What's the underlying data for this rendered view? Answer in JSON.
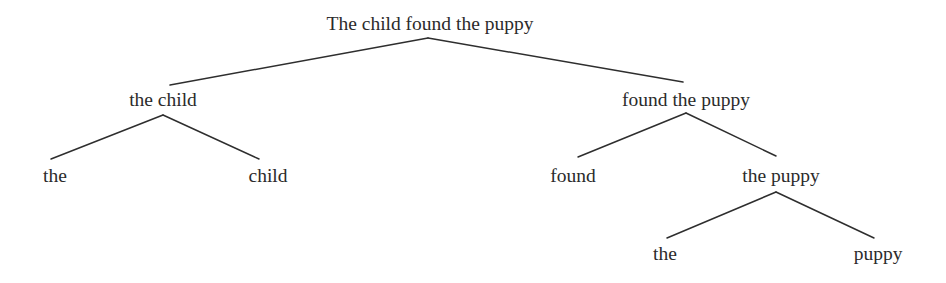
{
  "diagram": {
    "type": "constituency-tree",
    "colors": {
      "text": "#2b2b2b",
      "line": "#2e2e2e",
      "background": "#ffffff"
    },
    "nodes": {
      "root": {
        "label": "The child found the puppy",
        "x": 430,
        "top": 14
      },
      "np_subject": {
        "label": "the child",
        "x": 163,
        "top": 90
      },
      "vp": {
        "label": "found the puppy",
        "x": 686,
        "top": 90
      },
      "det_subject": {
        "label": "the",
        "x": 55,
        "top": 166
      },
      "noun_subject": {
        "label": "child",
        "x": 268,
        "top": 166
      },
      "verb": {
        "label": "found",
        "x": 573,
        "top": 166
      },
      "np_object": {
        "label": "the puppy",
        "x": 781,
        "top": 166
      },
      "det_object": {
        "label": "the",
        "x": 665,
        "top": 244
      },
      "noun_object": {
        "label": "puppy",
        "x": 878,
        "top": 244
      }
    },
    "edges": [
      {
        "from": "root",
        "to": "np_subject",
        "x1": 428,
        "y1": 38,
        "x2": 170,
        "y2": 85
      },
      {
        "from": "root",
        "to": "vp",
        "x1": 428,
        "y1": 38,
        "x2": 683,
        "y2": 82
      },
      {
        "from": "np_subject",
        "to": "det_subject",
        "x1": 163,
        "y1": 115,
        "x2": 51,
        "y2": 159
      },
      {
        "from": "np_subject",
        "to": "noun_subject",
        "x1": 163,
        "y1": 115,
        "x2": 259,
        "y2": 159
      },
      {
        "from": "vp",
        "to": "verb",
        "x1": 686,
        "y1": 113,
        "x2": 578,
        "y2": 157
      },
      {
        "from": "vp",
        "to": "np_object",
        "x1": 686,
        "y1": 113,
        "x2": 776,
        "y2": 156
      },
      {
        "from": "np_object",
        "to": "det_object",
        "x1": 776,
        "y1": 192,
        "x2": 667,
        "y2": 238
      },
      {
        "from": "np_object",
        "to": "noun_object",
        "x1": 776,
        "y1": 192,
        "x2": 874,
        "y2": 238
      }
    ]
  }
}
